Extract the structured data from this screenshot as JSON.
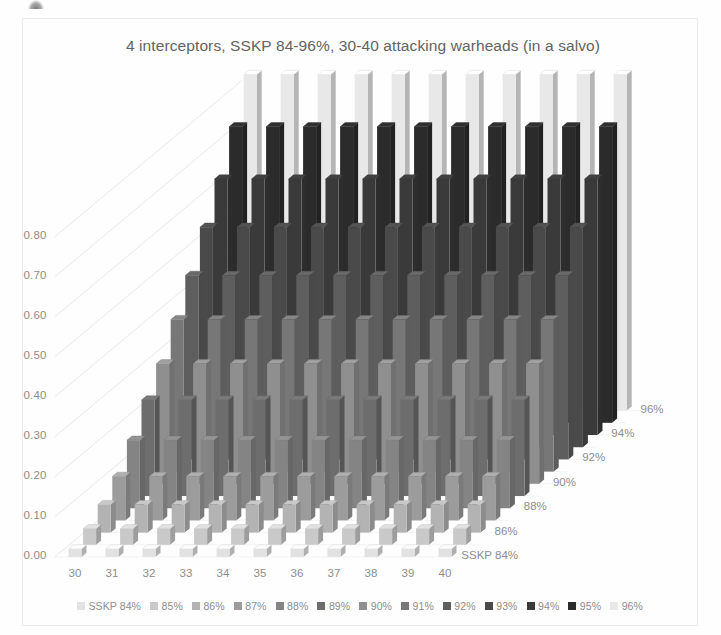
{
  "chart": {
    "title": "4 interceptors, SSKP 84-96%, 30-40 attacking warheads (in a salvo)"
  },
  "legend": {
    "items": [
      {
        "label": "SSKP 84%",
        "color": "#e2e2e2"
      },
      {
        "label": "85%",
        "color": "#c9c9c9"
      },
      {
        "label": "86%",
        "color": "#b3b3b3"
      },
      {
        "label": "87%",
        "color": "#9c9c9c"
      },
      {
        "label": "88%",
        "color": "#848484"
      },
      {
        "label": "89%",
        "color": "#6d6d6d"
      },
      {
        "label": "90%",
        "color": "#8f8f8f"
      },
      {
        "label": "91%",
        "color": "#777777"
      },
      {
        "label": "92%",
        "color": "#5e5e5e"
      },
      {
        "label": "93%",
        "color": "#4a4a4a"
      },
      {
        "label": "94%",
        "color": "#3a3a3a"
      },
      {
        "label": "95%",
        "color": "#2b2b2b"
      },
      {
        "label": "96%",
        "color": "#e8e8e8"
      }
    ]
  },
  "axes": {
    "y_ticks": [
      "0.80",
      "0.70",
      "0.60",
      "0.50",
      "0.40",
      "0.30",
      "0.20",
      "0.10",
      "0.00"
    ],
    "x_ticks": [
      "30",
      "31",
      "32",
      "33",
      "34",
      "35",
      "36",
      "37",
      "38",
      "39",
      "40"
    ],
    "z_ticks": [
      "96%",
      "94%",
      "92%",
      "90%",
      "88%",
      "86%",
      "SSKP 84%"
    ]
  },
  "chart_data": {
    "type": "bar",
    "title": "4 interceptors, SSKP 84-96%, 30-40 attacking warheads (in a salvo)",
    "xlabel": "",
    "ylabel": "",
    "zlabel": "SSKP",
    "ylim": [
      0.0,
      0.9
    ],
    "grid": true,
    "legend_position": "bottom",
    "three_d": true,
    "categories": [
      "30",
      "31",
      "32",
      "33",
      "34",
      "35",
      "36",
      "37",
      "38",
      "39",
      "40"
    ],
    "depth_categories": [
      "SSKP 84%",
      "85%",
      "86%",
      "87%",
      "88%",
      "89%",
      "90%",
      "91%",
      "92%",
      "93%",
      "94%",
      "95%",
      "96%"
    ],
    "series": [
      {
        "name": "SSKP 84%",
        "color": "#e2e2e2",
        "values": [
          0.02,
          0.02,
          0.02,
          0.02,
          0.02,
          0.02,
          0.02,
          0.02,
          0.02,
          0.02,
          0.02
        ]
      },
      {
        "name": "85%",
        "color": "#c9c9c9",
        "values": [
          0.04,
          0.04,
          0.04,
          0.04,
          0.04,
          0.04,
          0.04,
          0.04,
          0.04,
          0.04,
          0.04
        ]
      },
      {
        "name": "86%",
        "color": "#b3b3b3",
        "values": [
          0.07,
          0.07,
          0.07,
          0.07,
          0.07,
          0.07,
          0.07,
          0.07,
          0.07,
          0.07,
          0.07
        ]
      },
      {
        "name": "87%",
        "color": "#9c9c9c",
        "values": [
          0.11,
          0.11,
          0.11,
          0.11,
          0.11,
          0.11,
          0.11,
          0.11,
          0.11,
          0.11,
          0.11
        ]
      },
      {
        "name": "88%",
        "color": "#848484",
        "values": [
          0.17,
          0.17,
          0.17,
          0.17,
          0.17,
          0.17,
          0.17,
          0.17,
          0.17,
          0.17,
          0.17
        ]
      },
      {
        "name": "89%",
        "color": "#6d6d6d",
        "values": [
          0.24,
          0.24,
          0.24,
          0.24,
          0.24,
          0.24,
          0.24,
          0.24,
          0.24,
          0.24,
          0.24
        ]
      },
      {
        "name": "90%",
        "color": "#8f8f8f",
        "values": [
          0.3,
          0.3,
          0.3,
          0.3,
          0.3,
          0.3,
          0.3,
          0.3,
          0.3,
          0.3,
          0.3
        ]
      },
      {
        "name": "91%",
        "color": "#777777",
        "values": [
          0.38,
          0.38,
          0.38,
          0.38,
          0.38,
          0.38,
          0.38,
          0.38,
          0.38,
          0.38,
          0.38
        ]
      },
      {
        "name": "92%",
        "color": "#5e5e5e",
        "values": [
          0.46,
          0.46,
          0.46,
          0.46,
          0.46,
          0.46,
          0.46,
          0.46,
          0.46,
          0.46,
          0.46
        ]
      },
      {
        "name": "93%",
        "color": "#4a4a4a",
        "values": [
          0.55,
          0.55,
          0.55,
          0.55,
          0.55,
          0.55,
          0.55,
          0.55,
          0.55,
          0.55,
          0.55
        ]
      },
      {
        "name": "94%",
        "color": "#3a3a3a",
        "values": [
          0.64,
          0.64,
          0.64,
          0.64,
          0.64,
          0.64,
          0.64,
          0.64,
          0.64,
          0.64,
          0.64
        ]
      },
      {
        "name": "95%",
        "color": "#2b2b2b",
        "values": [
          0.74,
          0.74,
          0.74,
          0.74,
          0.74,
          0.74,
          0.74,
          0.74,
          0.74,
          0.74,
          0.74
        ]
      },
      {
        "name": "96%",
        "color": "#e8e8e8",
        "values": [
          0.84,
          0.84,
          0.84,
          0.84,
          0.84,
          0.84,
          0.84,
          0.84,
          0.84,
          0.84,
          0.84
        ]
      }
    ]
  }
}
